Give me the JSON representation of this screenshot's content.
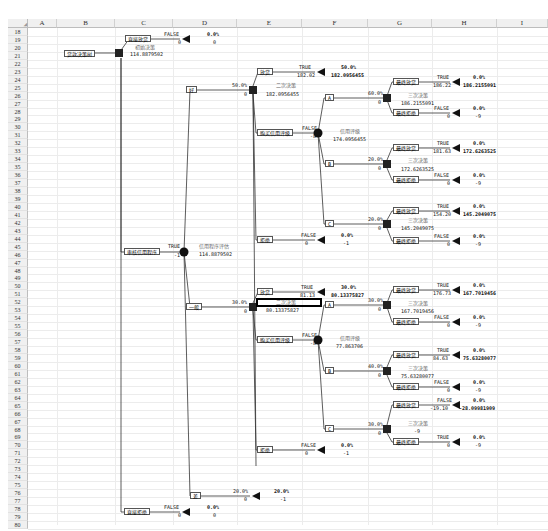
{
  "spreadsheet": {
    "columns": [
      "A",
      "B",
      "C",
      "D",
      "E",
      "F",
      "G",
      "H",
      "I"
    ],
    "rows": [
      "18",
      "19",
      "20",
      "21",
      "22",
      "23",
      "24",
      "25",
      "26",
      "27",
      "28",
      "29",
      "30",
      "31",
      "32",
      "33",
      "34",
      "35",
      "36",
      "37",
      "38",
      "39",
      "40",
      "41",
      "42",
      "43",
      "44",
      "45",
      "46",
      "47",
      "48",
      "49",
      "50",
      "51",
      "52",
      "53",
      "54",
      "55",
      "56",
      "57",
      "58",
      "59",
      "60",
      "61",
      "62",
      "63",
      "64",
      "65",
      "66",
      "67",
      "68",
      "69",
      "70",
      "71",
      "72",
      "73",
      "74",
      "75",
      "76",
      "77",
      "78",
      "79",
      "80"
    ]
  },
  "tree": {
    "root": {
      "label": "贷款决策树",
      "decision_title": "初始决策",
      "decision_value": "114.8879502"
    },
    "direct_loan": {
      "label": "直接放贷",
      "flag": "FALSE",
      "payoff": "0",
      "prob": "0.0%",
      "value": "0"
    },
    "direct_reject": {
      "label": "直接拒绝",
      "flag": "FALSE",
      "payoff": "0",
      "prob": "0.0%",
      "value": "0"
    },
    "credit_check": {
      "label": "审核信用程序",
      "flag": "TRUE",
      "payoff": "-1",
      "chance_title": "信用程序评估",
      "chance_value": "114.8879502"
    },
    "good": {
      "label": "好",
      "prob": "50.0%",
      "payoff": "0",
      "decision_title": "二次决策",
      "decision_value": "182.0956455",
      "loan": {
        "label": "放贷",
        "flag": "TRUE",
        "payoff": "182.02",
        "prob": "50.0%",
        "value": "182.0956455"
      },
      "reject": {
        "label": "拒绝",
        "flag": "FALSE",
        "payoff": "0",
        "prob": "0.0%",
        "value": "-1"
      },
      "rating": {
        "label": "购买信用评级",
        "flag": "FALSE",
        "payoff": "-8",
        "chance_title": "信用评级",
        "chance_value": "174.0956455",
        "branches": [
          {
            "label": "A",
            "prob": "60.0%",
            "payoff": "0",
            "decision_title": "三次决策",
            "decision_value": "186.2155091",
            "loan": {
              "label": "最终放贷",
              "flag": "TRUE",
              "payoff": "186.22",
              "prob": "0.0%",
              "value": "186.2155091"
            },
            "reject": {
              "label": "最终拒绝",
              "flag": "FALSE",
              "payoff": "0",
              "prob": "0.0%",
              "value": "-9"
            }
          },
          {
            "label": "B",
            "prob": "20.0%",
            "payoff": "0",
            "decision_title": "三次决策",
            "decision_value": "172.6263525",
            "loan": {
              "label": "最终放贷",
              "flag": "TRUE",
              "payoff": "181.63",
              "prob": "0.0%",
              "value": "172.6263525"
            },
            "reject": {
              "label": "最终拒绝",
              "flag": "FALSE",
              "payoff": "0",
              "prob": "0.0%",
              "value": "-9"
            }
          },
          {
            "label": "C",
            "prob": "20.0%",
            "payoff": "0",
            "decision_title": "三次决策",
            "decision_value": "145.2049075",
            "loan": {
              "label": "最终放贷",
              "flag": "TRUE",
              "payoff": "154.20",
              "prob": "0.0%",
              "value": "145.2049075"
            },
            "reject": {
              "label": "最终拒绝",
              "flag": "FALSE",
              "payoff": "0",
              "prob": "0.0%",
              "value": "-9"
            }
          }
        ]
      }
    },
    "average": {
      "label": "一般",
      "prob": "30.0%",
      "payoff": "0",
      "decision_title": "二次决策",
      "decision_value": "80.13375827",
      "loan": {
        "label": "放贷",
        "flag": "TRUE",
        "payoff": "81.13",
        "prob": "30.0%",
        "value": "80.13375827"
      },
      "reject": {
        "label": "拒绝",
        "flag": "FALSE",
        "payoff": "0",
        "prob": "0.0%",
        "value": "-1"
      },
      "rating": {
        "label": "购买信用评级",
        "flag": "FALSE",
        "payoff": "-8",
        "chance_title": "信用评级",
        "chance_value": "77.863706",
        "branches": [
          {
            "label": "A",
            "prob": "30.0%",
            "payoff": "0",
            "decision_title": "三次决策",
            "decision_value": "167.7019456",
            "loan": {
              "label": "最终放贷",
              "flag": "TRUE",
              "payoff": "176.73",
              "prob": "0.0%",
              "value": "167.7019456"
            },
            "reject": {
              "label": "最终拒绝",
              "flag": "FALSE",
              "payoff": "0",
              "prob": "0.0%",
              "value": "-9"
            }
          },
          {
            "label": "B",
            "prob": "40.0%",
            "payoff": "0",
            "decision_title": "三次决策",
            "decision_value": "75.63280077",
            "loan": {
              "label": "最终放贷",
              "flag": "TRUE",
              "payoff": "84.63",
              "prob": "0.0%",
              "value": "75.63280077"
            },
            "reject": {
              "label": "最终拒绝",
              "flag": "FALSE",
              "payoff": "0",
              "prob": "0.0%",
              "value": "-9"
            }
          },
          {
            "label": "C",
            "prob": "30.0%",
            "payoff": "0",
            "decision_title": "三次决策",
            "decision_value": "-9",
            "loan": {
              "label": "最终放贷",
              "flag": "FALSE",
              "payoff": "-19.10",
              "prob": "0.0%",
              "value": "-28.09981909"
            },
            "reject": {
              "label": "最终拒绝",
              "flag": "TRUE",
              "payoff": "0",
              "prob": "0.0%",
              "value": "-9"
            }
          }
        ]
      }
    },
    "bad": {
      "label": "差",
      "prob": "20.0%",
      "payoff": "0",
      "end_prob": "20.0%",
      "end_value": "-1"
    }
  }
}
